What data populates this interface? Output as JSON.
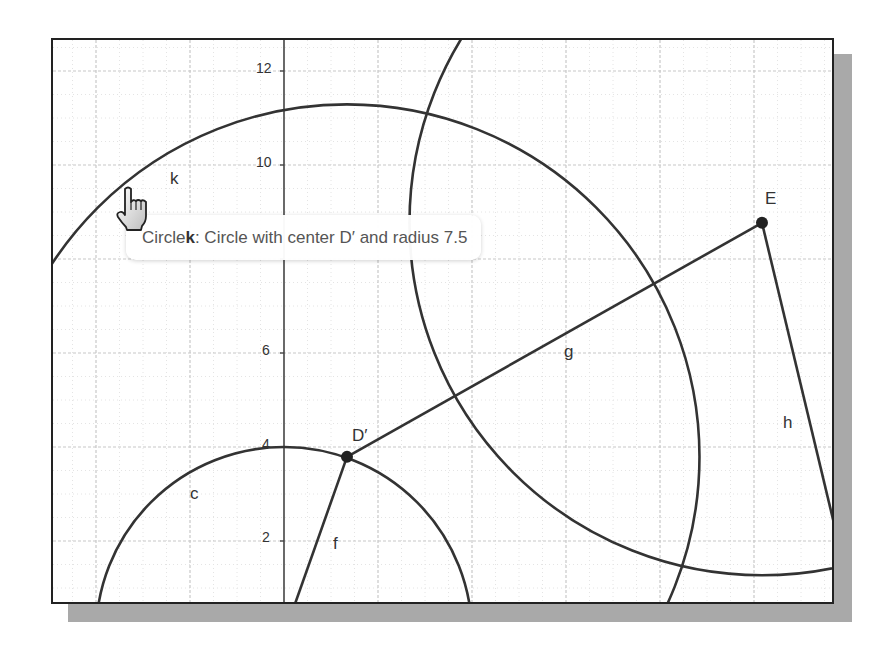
{
  "app": "Geometry graphics view",
  "view": {
    "origin_px": [
      282,
      633
    ],
    "unit_px": 47,
    "frame": {
      "left": 51,
      "top": 38,
      "right": 834,
      "bottom": 604
    },
    "colors": {
      "object": "#333333",
      "grid_major": "#c8c8c8",
      "grid_minor": "#e4e4e4",
      "axis": "#444444",
      "shadow": "#a9a9a9"
    }
  },
  "axis": {
    "y_ticks": [
      {
        "label": "12",
        "y": 12
      },
      {
        "label": "10",
        "y": 10
      },
      {
        "label": "6",
        "y": 6
      },
      {
        "label": "4",
        "y": 4
      },
      {
        "label": "2",
        "y": 2
      }
    ]
  },
  "objects": {
    "circle_c": {
      "label": "c",
      "center": [
        0,
        0
      ],
      "radius": 4
    },
    "circle_k": {
      "label": "k",
      "center": "D'",
      "radius": 7.5
    },
    "circle_e": {
      "center": "E",
      "radius": 7.5
    },
    "point_D": {
      "label": "D′",
      "x": 1.34,
      "y": 3.79
    },
    "point_E": {
      "label": "E",
      "x": 10.17,
      "y": 8.77
    },
    "segment_f": {
      "label": "f"
    },
    "segment_g": {
      "label": "g"
    },
    "segment_h": {
      "label": "h"
    }
  },
  "tooltip": {
    "prefix": "Circle ",
    "name": "k",
    "suffix": ": Circle with center D′ and radius 7.5"
  },
  "cursor": {
    "icon": "hand-pointer-icon"
  }
}
